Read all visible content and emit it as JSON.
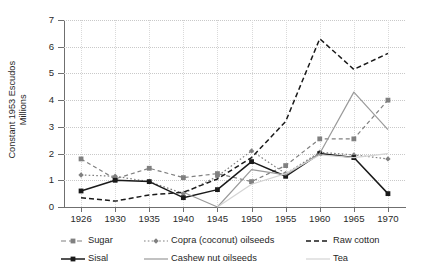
{
  "chart_data": {
    "type": "line",
    "title": "",
    "xlabel": "",
    "ylabel": "Constant 1953 Escudos\nMillions",
    "ylim": [
      0,
      7
    ],
    "yticks": [
      0,
      1,
      2,
      3,
      4,
      5,
      6,
      7
    ],
    "grid": true,
    "legend_position": "bottom",
    "x": [
      1926,
      1930,
      1935,
      1940,
      1945,
      1950,
      1955,
      1960,
      1965,
      1970
    ],
    "categories": [
      "1926",
      "1930",
      "1935",
      "1940",
      "1945",
      "1950",
      "1955",
      "1960",
      "1965",
      "1970"
    ],
    "series": [
      {
        "name": "Sugar",
        "color": "#808080",
        "dash": "dashed",
        "marker": "square",
        "values": [
          1.8,
          1.05,
          1.45,
          1.1,
          1.25,
          0.95,
          1.55,
          2.55,
          2.55,
          4.0
        ]
      },
      {
        "name": "Copra (coconut) oilseeds",
        "color": "#808080",
        "dash": "dotted",
        "marker": "diamond",
        "values": [
          1.2,
          1.15,
          0.95,
          0.5,
          1.15,
          2.1,
          1.25,
          2.05,
          1.95,
          1.8
        ]
      },
      {
        "name": "Raw cotton",
        "color": "#1a1a1a",
        "dash": "dashed",
        "marker": "none",
        "values": [
          0.35,
          0.22,
          0.45,
          0.55,
          1.05,
          1.85,
          3.2,
          6.3,
          5.15,
          5.75
        ]
      },
      {
        "name": "Sisal",
        "color": "#1a1a1a",
        "dash": "solid",
        "marker": "square",
        "values": [
          0.6,
          1.0,
          0.95,
          0.35,
          0.65,
          1.7,
          1.15,
          2.0,
          1.85,
          0.5
        ]
      },
      {
        "name": "Cashew nut oilseeds",
        "color": "#9a9a9a",
        "dash": "solid",
        "marker": "none",
        "values": [
          null,
          null,
          null,
          0.55,
          0.0,
          1.4,
          1.2,
          2.0,
          4.3,
          2.9
        ]
      },
      {
        "name": "Tea",
        "color": "#d4d4d4",
        "dash": "solid",
        "marker": "none",
        "values": [
          null,
          null,
          null,
          null,
          0.0,
          0.85,
          1.25,
          1.95,
          1.85,
          2.0
        ]
      }
    ]
  },
  "axes": {
    "y_title": "Constant 1953 Escudos\nMillions",
    "y_ticks": [
      "0",
      "1",
      "2",
      "3",
      "4",
      "5",
      "6",
      "7"
    ],
    "x_ticks": [
      "1926",
      "1930",
      "1935",
      "1940",
      "1945",
      "1950",
      "1955",
      "1960",
      "1965",
      "1970"
    ]
  },
  "legend": {
    "items": [
      {
        "label": "Sugar",
        "symbol": "dashed-square"
      },
      {
        "label": "Copra (coconut) oilseeds",
        "symbol": "dotted-diamond"
      },
      {
        "label": "Raw cotton",
        "symbol": "dashed-line"
      },
      {
        "label": "Sisal",
        "symbol": "solid-square"
      },
      {
        "label": "Cashew nut oilseeds",
        "symbol": "solid-line-gray"
      },
      {
        "label": "Tea",
        "symbol": "solid-line-light"
      }
    ]
  }
}
